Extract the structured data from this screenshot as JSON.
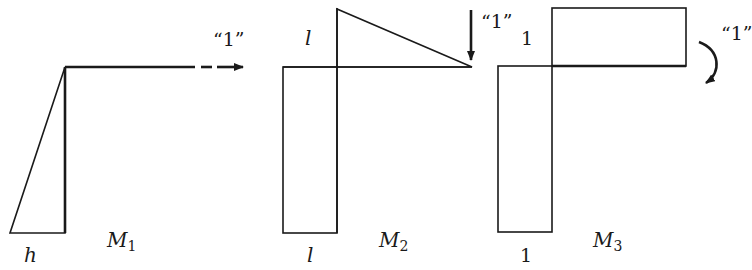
{
  "diagrams": [
    {
      "name": "M1",
      "label_main": "M",
      "label_sub": "1",
      "base_label": "h",
      "load_label": "“1”",
      "load_type": "horizontal force"
    },
    {
      "name": "M2",
      "label_main": "M",
      "label_sub": "2",
      "top_label": "l",
      "base_label": "l",
      "load_label": "“1”",
      "load_type": "vertical force"
    },
    {
      "name": "M3",
      "label_main": "M",
      "label_sub": "3",
      "top_label": "1",
      "base_label": "1",
      "load_label": "“1”",
      "load_type": "moment"
    }
  ],
  "colors": {
    "line": "#1a1a1a",
    "background": "#ffffff"
  }
}
